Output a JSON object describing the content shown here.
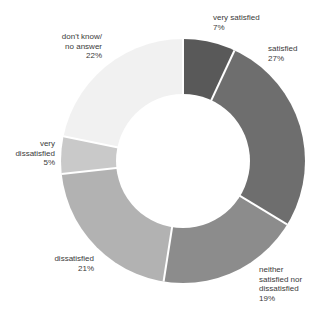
{
  "chart_data": {
    "type": "pie",
    "subtype": "donut",
    "title": "",
    "unit": "%",
    "direction": "clockwise",
    "start_angle_deg": 0,
    "background": "#ffffff",
    "divider_color": "#ffffff",
    "text_color": "#3a3a3a",
    "segments": [
      {
        "label": "very satisfied",
        "value": 7,
        "pct_label": "7%",
        "color": "#595959",
        "lines": [
          "very satisfied",
          "7%"
        ]
      },
      {
        "label": "satisfied",
        "value": 27,
        "pct_label": "27%",
        "color": "#6e6e6e",
        "lines": [
          "satisfied",
          "27%"
        ]
      },
      {
        "label": "neither satisfied nor dissatisfied",
        "value": 19,
        "pct_label": "19%",
        "color": "#8c8c8c",
        "lines": [
          "neither",
          "satisfied nor",
          "dissatisfied",
          "19%"
        ]
      },
      {
        "label": "dissatisfied",
        "value": 21,
        "pct_label": "21%",
        "color": "#b2b2b2",
        "lines": [
          "dissatisfied",
          "21%"
        ]
      },
      {
        "label": "very dissatisfied",
        "value": 5,
        "pct_label": "5%",
        "color": "#c9c9c9",
        "lines": [
          "very",
          "dissatisfied",
          "5%"
        ]
      },
      {
        "label": "don't know/no answer",
        "value": 22,
        "pct_label": "22%",
        "color": "#f1f1f1",
        "lines": [
          "don't know/",
          "no answer",
          "22%"
        ]
      }
    ]
  }
}
